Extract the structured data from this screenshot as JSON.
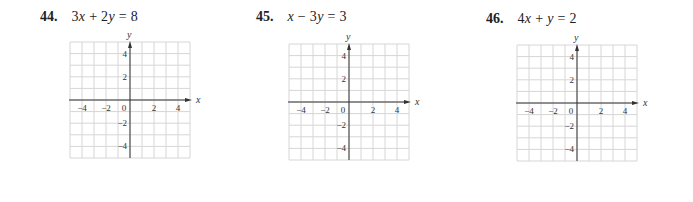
{
  "page": {
    "background": "#ffffff",
    "grid_line_color": "#d6d6d6",
    "axis_color": "#333333"
  },
  "problems": [
    {
      "number": "44.",
      "equation": "3x + 2y = 8",
      "equation_parts": [
        "3",
        "x",
        " + 2",
        "y",
        " = 8"
      ],
      "grid": {
        "x_axis_label": "x",
        "y_axis_label": "y",
        "x_ticks": [
          "−4",
          "−2",
          "0",
          "2",
          "4"
        ],
        "y_ticks": [
          "4",
          "2",
          "−2",
          "−4"
        ],
        "range": [
          -5,
          5
        ]
      }
    },
    {
      "number": "45.",
      "equation": "x − 3y = 3",
      "equation_parts": [
        "",
        "x",
        " − 3",
        "y",
        " = 3"
      ],
      "grid": {
        "x_axis_label": "x",
        "y_axis_label": "y",
        "x_ticks": [
          "−4",
          "−2",
          "0",
          "2",
          "4"
        ],
        "y_ticks": [
          "4",
          "2",
          "−2",
          "−4"
        ],
        "range": [
          -5,
          5
        ]
      }
    },
    {
      "number": "46.",
      "equation": "4x + y = 2",
      "equation_parts": [
        "4",
        "x",
        " + ",
        "y",
        " = 2"
      ],
      "grid": {
        "x_axis_label": "x",
        "y_axis_label": "y",
        "x_ticks": [
          "−4",
          "−2",
          "0",
          "2",
          "4"
        ],
        "y_ticks": [
          "4",
          "2",
          "−2",
          "−4"
        ],
        "range": [
          -5,
          5
        ]
      }
    }
  ]
}
